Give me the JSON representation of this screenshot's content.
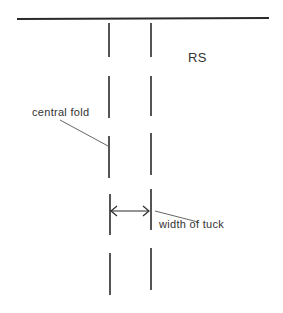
{
  "diagram": {
    "labels": {
      "side": "RS",
      "fold": "central fold",
      "tuck": "width of tuck"
    },
    "colors": {
      "line": "#2a2a2a",
      "leader": "#555555",
      "background": "#ffffff"
    }
  }
}
